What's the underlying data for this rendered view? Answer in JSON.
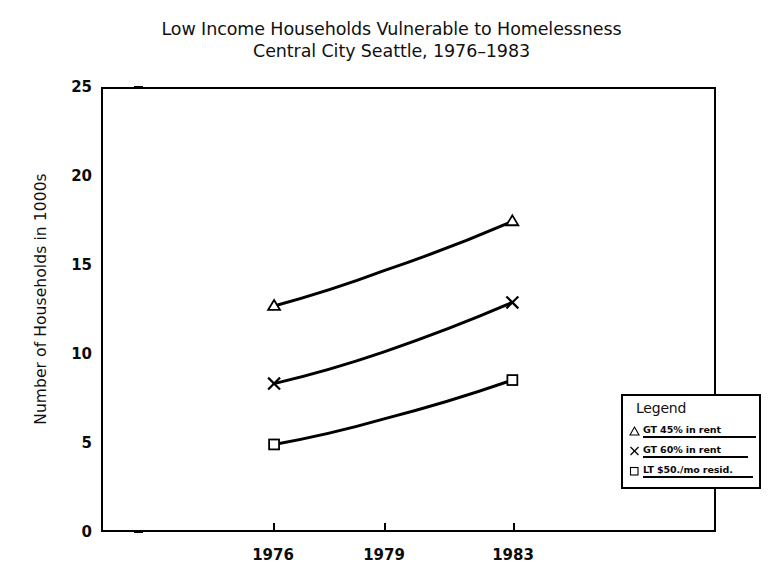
{
  "chart_data": {
    "type": "line",
    "title": "Low Income Households Vulnerable to Homelessness",
    "subtitle": "Central City Seattle, 1976–1983",
    "title_lines": [
      "Low Income Households Vulnerable to Homelessness",
      "Central City Seattle, 1976–1983"
    ],
    "xlabel": "",
    "ylabel": "Number of Households in 1000s",
    "x": [
      1976,
      1979,
      1983
    ],
    "categories": [
      "1976",
      "1979",
      "1983"
    ],
    "xtick_labels": [
      "1976",
      "1979",
      "1983"
    ],
    "xtick_positions_pct": [
      28.0,
      46.0,
      67.0
    ],
    "ytick_labels": [
      "0",
      "5",
      "10",
      "15",
      "20",
      "25"
    ],
    "ytick_values": [
      0,
      5,
      10,
      15,
      20,
      25
    ],
    "ylim": [
      0,
      25
    ],
    "grid": false,
    "legend_position": "lower right",
    "series": [
      {
        "name": "GT 45% in rent",
        "marker": "triangle",
        "values": [
          12.7,
          14.7,
          17.5
        ]
      },
      {
        "name": "GT 60% in rent",
        "marker": "x",
        "values": [
          8.3,
          10.1,
          12.9
        ]
      },
      {
        "name": "LT $50./mo resid.",
        "marker": "square",
        "values": [
          4.85,
          6.3,
          8.5
        ]
      }
    ],
    "line_color": "#000000",
    "background_color": "#ffffff"
  },
  "legend": {
    "heading": "Legend",
    "entries": [
      {
        "marker_name": "triangle-marker",
        "label": "GT 45% in rent"
      },
      {
        "marker_name": "x-marker",
        "label": "GT 60% in rent"
      },
      {
        "marker_name": "square-marker",
        "label": "LT $50./mo resid."
      }
    ]
  }
}
